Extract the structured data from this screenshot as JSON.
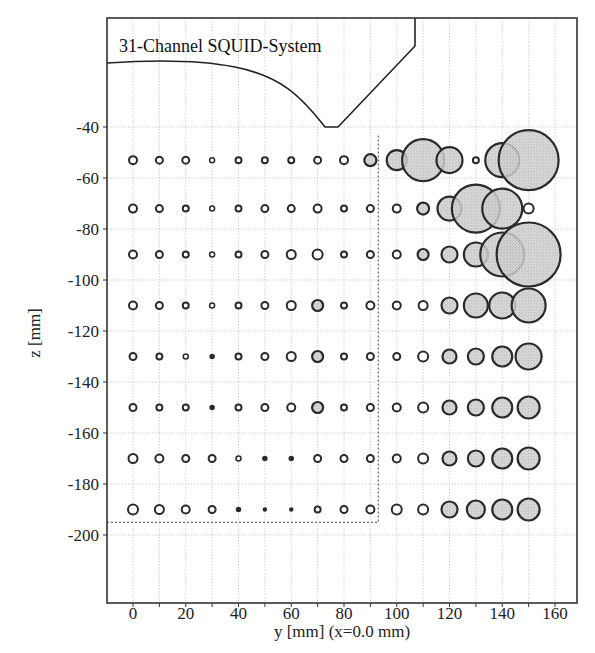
{
  "chart_data": {
    "type": "scatter",
    "subtype": "bubble-grid",
    "title": "31-Channel SQUID-System",
    "xlabel": "y [mm] (x=0.0 mm)",
    "ylabel": "z [mm]",
    "xlim": [
      -10,
      170
    ],
    "ylim": [
      -228,
      3
    ],
    "xticks": [
      0,
      20,
      40,
      60,
      80,
      100,
      120,
      140,
      160
    ],
    "xtick_labels": [
      "0",
      "20",
      "40",
      "60",
      "80",
      "100",
      "120",
      "140",
      "160"
    ],
    "yticks": [
      -40,
      -60,
      -80,
      -100,
      -120,
      -140,
      -160,
      -180,
      -200
    ],
    "ytick_labels": [
      "-40",
      "-60",
      "-80",
      "-100",
      "-120",
      "-140",
      "-160",
      "-180",
      "-200"
    ],
    "grid": true,
    "x_positions": [
      0,
      10,
      20,
      30,
      40,
      50,
      60,
      70,
      80,
      90,
      100,
      110,
      120,
      130,
      140,
      150
    ],
    "z_positions": [
      -53,
      -72,
      -90,
      -110,
      -130,
      -150,
      -170,
      -190
    ],
    "bubble_radius_px": [
      [
        4,
        3.5,
        3.5,
        2.5,
        3,
        3,
        3,
        3.5,
        4,
        6,
        10,
        21,
        13,
        3,
        17,
        30
      ],
      [
        4,
        3.5,
        3,
        2.5,
        3,
        3.5,
        3.5,
        4,
        3,
        3.5,
        4,
        6,
        12,
        24,
        20,
        5
      ],
      [
        4,
        3.5,
        3,
        2.5,
        3,
        3.5,
        4.5,
        5,
        3,
        3.5,
        4,
        5.5,
        8,
        12,
        22,
        32
      ],
      [
        4,
        3.5,
        3,
        2.5,
        3,
        3.5,
        4.5,
        5.5,
        3,
        4,
        4,
        4.5,
        8,
        12,
        13,
        17
      ],
      [
        3.5,
        3,
        2.5,
        2,
        3,
        3.5,
        4.5,
        5.5,
        3,
        3.5,
        3.5,
        5,
        7,
        8,
        10,
        13
      ],
      [
        3.5,
        3,
        3,
        2,
        3,
        3.5,
        4,
        5.5,
        3,
        3.5,
        4,
        5,
        7,
        8,
        10,
        11
      ],
      [
        4.5,
        4,
        3.5,
        3.5,
        2.5,
        2,
        2,
        3.5,
        3.5,
        3.5,
        4,
        5,
        7,
        8,
        10,
        11
      ],
      [
        5,
        4.5,
        4,
        3.5,
        2,
        1.5,
        1.5,
        3,
        3.5,
        4,
        5,
        5,
        8,
        9,
        10,
        11
      ]
    ],
    "highlight_fill": "#c8c8c8",
    "measurement_region": {
      "y_max_mm": 93,
      "z_min_mm": -195,
      "style": "dashed"
    },
    "sensor_outline": "curved dewar bottom with V-notch reaching z=-40 near y=75"
  },
  "colors": {
    "background": "#ffffff",
    "frame": "#333333",
    "grid": "#c8c8c8",
    "bubble_stroke": "#2a2a2a",
    "bubble_fill_large": "#c6c6c6",
    "bubble_fill_small": "#ffffff"
  }
}
